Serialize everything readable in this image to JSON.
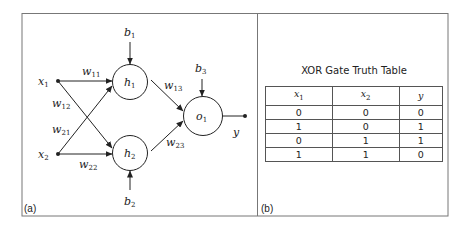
{
  "panels": {
    "a": {
      "label": "(a)"
    },
    "b": {
      "label": "(b)"
    }
  },
  "network": {
    "inputs": [
      {
        "name": "x",
        "sub": "1"
      },
      {
        "name": "x",
        "sub": "2"
      }
    ],
    "hidden": [
      {
        "name": "h",
        "sub": "1"
      },
      {
        "name": "h",
        "sub": "2"
      }
    ],
    "output_node": {
      "name": "o",
      "sub": "1"
    },
    "output": {
      "name": "y"
    },
    "biases": [
      {
        "name": "b",
        "sub": "1"
      },
      {
        "name": "b",
        "sub": "2"
      },
      {
        "name": "b",
        "sub": "3"
      }
    ],
    "weights": [
      {
        "name": "w",
        "sub": "11"
      },
      {
        "name": "w",
        "sub": "12"
      },
      {
        "name": "w",
        "sub": "21"
      },
      {
        "name": "w",
        "sub": "22"
      },
      {
        "name": "w",
        "sub": "13"
      },
      {
        "name": "w",
        "sub": "23"
      }
    ]
  },
  "table": {
    "title": "XOR Gate Truth Table",
    "headers": [
      {
        "name": "x",
        "sub": "1"
      },
      {
        "name": "x",
        "sub": "2"
      },
      {
        "name": "y",
        "sub": ""
      }
    ],
    "rows": [
      [
        "0",
        "0",
        "0"
      ],
      [
        "1",
        "0",
        "1"
      ],
      [
        "0",
        "1",
        "1"
      ],
      [
        "1",
        "1",
        "0"
      ]
    ]
  }
}
